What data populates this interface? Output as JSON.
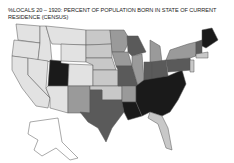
{
  "map": {
    "title": "%LOCALS 20 – 1920: PERCENT OF POPULATION BORN IN STATE OF CURRENT RESIDENCE (CENSUS)",
    "type": "choropleth",
    "region": "United States",
    "shades": {
      "lightest": "#e2e2e2",
      "light": "#c8c8c8",
      "medium": "#9a9a9a",
      "dark": "#5a5a5a",
      "darkest": "#1a1a1a"
    }
  }
}
